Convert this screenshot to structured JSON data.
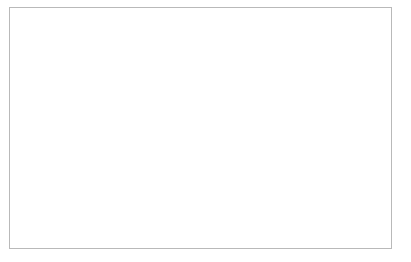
{
  "chart_data": {
    "type": "line",
    "title": "",
    "xlabel": "Year",
    "ylabel": "Number",
    "xlim": [
      60,
      91
    ],
    "ylim": [
      0,
      16000
    ],
    "ytick_values": [
      0,
      2000,
      4000,
      6000,
      8000,
      10000,
      12000,
      14000,
      16000
    ],
    "ytick_labels": [
      "0",
      "2,000",
      "4,000",
      "6,000",
      "8,000",
      "10,000",
      "12,000",
      "14,000",
      "16,000"
    ],
    "xtick_values": [
      60,
      62,
      64,
      66,
      68,
      70,
      72,
      74,
      76,
      78,
      80,
      82,
      84,
      86,
      88,
      90
    ],
    "xtick_labels": [
      "60",
      "62",
      "64",
      "66",
      "68",
      "70",
      "72",
      "74",
      "76",
      "78",
      "80",
      "82",
      "84",
      "86",
      "88",
      "90"
    ],
    "xminor_values": [
      61,
      63,
      65,
      67,
      69,
      71,
      73,
      75,
      77,
      79,
      81,
      83,
      85,
      87,
      89,
      91
    ],
    "grid": "horizontal",
    "legend_position": "top-left-inside",
    "x": [
      61,
      62,
      63,
      64,
      65,
      66,
      67,
      68,
      69,
      70,
      71,
      72,
      73,
      74,
      75,
      76,
      77,
      78,
      79,
      80,
      81,
      82,
      83,
      84,
      85,
      86,
      87,
      88,
      89,
      90,
      91
    ],
    "series": [
      {
        "name": "Warheads",
        "color": "#7b7b7b",
        "width": 2.1,
        "values": [
          3100,
          3150,
          3600,
          4150,
          4700,
          5050,
          5600,
          6250,
          6100,
          6000,
          6150,
          7100,
          8300,
          9850,
          10400,
          10800,
          11100,
          11250,
          11250,
          11150,
          10850,
          10500,
          10300,
          10600,
          11100,
          11600,
          12300,
          13800,
          13100,
          12700,
          12350
        ]
      },
      {
        "name": "Launchers",
        "color": "#1a1a1a",
        "width": 2.5,
        "values": [
          1550,
          1500,
          1600,
          1750,
          2050,
          1900,
          2150,
          2300,
          2250,
          2150,
          2150,
          2150,
          2200,
          2180,
          2160,
          2150,
          2150,
          2150,
          2150,
          2150,
          2120,
          2080,
          2050,
          2050,
          2060,
          2070,
          2080,
          2100,
          2050,
          2000,
          1980
        ]
      }
    ]
  },
  "legend": {
    "entries": [
      {
        "label": "Warheads"
      },
      {
        "label": "Launchers"
      }
    ]
  },
  "axes": {
    "y_title": "Number",
    "x_title": "Year"
  }
}
